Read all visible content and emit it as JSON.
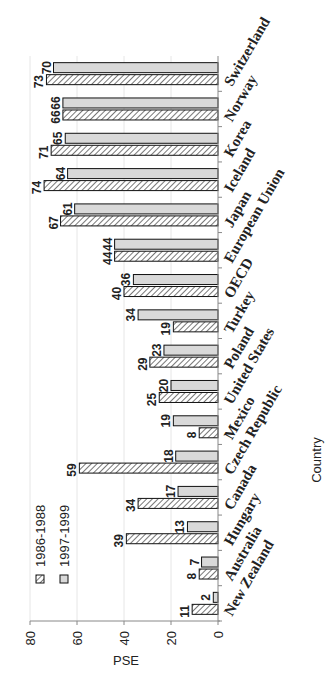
{
  "chart_data": {
    "type": "bar",
    "orientation": "rotated-90-ccw",
    "title": "",
    "xlabel": "Country",
    "ylabel": "PSE",
    "ylim": [
      0,
      80
    ],
    "yticks": [
      0,
      20,
      40,
      60,
      80
    ],
    "grid": true,
    "legend_position": "bottom-left",
    "categories": [
      "New Zealand",
      "Australia",
      "Hungary",
      "Canada",
      "Czech Republic",
      "Mexico",
      "United States",
      "Poland",
      "Turkey",
      "OECD",
      "European Union",
      "Japan",
      "Iceland",
      "Korea",
      "Norway",
      "Switzerland"
    ],
    "series": [
      {
        "name": "1986-1988",
        "pattern": "hatched",
        "values": [
          11,
          8,
          39,
          34,
          59,
          8,
          25,
          29,
          19,
          40,
          44,
          67,
          74,
          71,
          66,
          73
        ]
      },
      {
        "name": "1997-1999",
        "pattern": "light-gray",
        "values": [
          2,
          7,
          13,
          17,
          18,
          19,
          20,
          23,
          34,
          36,
          44,
          61,
          64,
          65,
          66,
          70
        ]
      }
    ]
  },
  "colors": {
    "bar_fill_light": "#d9d9d9",
    "hatch": "#555555",
    "outline": "#111111",
    "grid": "#e6e6e6"
  }
}
